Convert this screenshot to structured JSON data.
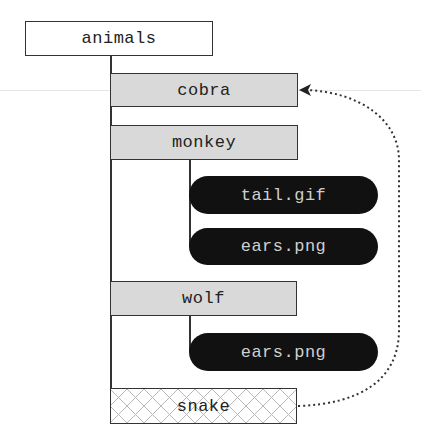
{
  "diagram": {
    "type": "tree",
    "root": {
      "label": "animals"
    },
    "nodes": [
      {
        "label": "cobra",
        "kind": "folder",
        "parent": "animals"
      },
      {
        "label": "monkey",
        "kind": "folder",
        "parent": "animals"
      },
      {
        "label": "tail.gif",
        "kind": "file",
        "parent": "monkey"
      },
      {
        "label": "ears.png",
        "kind": "file",
        "parent": "monkey"
      },
      {
        "label": "wolf",
        "kind": "folder",
        "parent": "animals"
      },
      {
        "label": "ears.png",
        "kind": "file",
        "parent": "wolf"
      },
      {
        "label": "snake",
        "kind": "link",
        "parent": "animals"
      }
    ],
    "edges": [
      {
        "from": "snake",
        "to": "cobra",
        "style": "dotted-arrow"
      }
    ],
    "colors": {
      "line": "#333333",
      "folder_fill": "#d9d9d9",
      "file_fill": "#111111",
      "file_text": "#cfcfcf",
      "hatch": "#b8b8b8"
    }
  }
}
